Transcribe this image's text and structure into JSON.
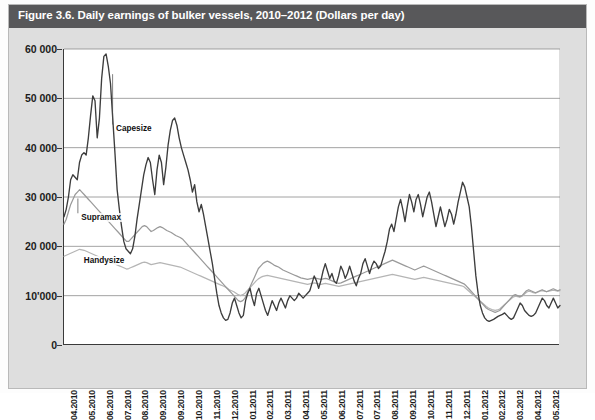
{
  "figure": {
    "title": "Figure 3.6. Daily earnings of bulker vessels, 2010–2012 (Dollars per day)"
  },
  "colors": {
    "title_bar": "#58585a",
    "panel_bg": "#dedede",
    "plot_bg": "#ffffff",
    "axis": "#3a3a3a",
    "grid": "#8c8c8c",
    "capesize": "#3d3d3d",
    "supramax": "#9a9a9a",
    "handysize": "#b5b5b5"
  },
  "chart_data": {
    "type": "line",
    "title": "Figure 3.6. Daily earnings of bulker vessels, 2010–2012 (Dollars per day)",
    "xlabel": "",
    "ylabel": "",
    "ylim": [
      0,
      60000
    ],
    "yticks": [
      0,
      10000,
      20000,
      30000,
      40000,
      50000,
      60000
    ],
    "ytick_labels": [
      "0",
      "10'000",
      "20 000",
      "30 000",
      "40 000",
      "50 000",
      "60 000"
    ],
    "grid": true,
    "legend": "inline-annotations",
    "xtick_labels": [
      "04.2010",
      "05.2010",
      "06.2010",
      "07.2010",
      "08.2010",
      "09.2010",
      "09.2010",
      "10.2010",
      "11.2010",
      "12.2010",
      "01.2011",
      "02.2011",
      "03.2011",
      "04.2011",
      "05.2011",
      "06.2011",
      "07.2011",
      "07.2011",
      "08.2011",
      "09.2011",
      "10.2011",
      "11.2011",
      "12.2011",
      "01.2012",
      "02.2012",
      "03.2012",
      "04.2012",
      "05.2012"
    ],
    "annotations": [
      {
        "text": "Capesize",
        "series": "Capesize"
      },
      {
        "text": "Supramax",
        "series": "Supramax"
      },
      {
        "text": "Handysize",
        "series": "Handysize"
      }
    ],
    "series": [
      {
        "name": "Capesize",
        "color": "#3d3d3d",
        "values": [
          26000,
          27500,
          30000,
          33500,
          34500,
          34000,
          33500,
          37000,
          38500,
          39000,
          38500,
          42000,
          46500,
          50500,
          49500,
          42000,
          46000,
          54000,
          58500,
          59000,
          56500,
          53000,
          46000,
          39000,
          31500,
          27500,
          24000,
          21000,
          19500,
          19000,
          18500,
          19500,
          22000,
          25500,
          28500,
          31500,
          34500,
          36500,
          38000,
          37000,
          33500,
          30500,
          35500,
          38500,
          37000,
          32500,
          36000,
          40500,
          43500,
          45500,
          46000,
          44500,
          42000,
          40000,
          38500,
          37000,
          35500,
          33500,
          31000,
          32500,
          29000,
          27000,
          28500,
          26500,
          24000,
          21500,
          19000,
          16500,
          13500,
          10500,
          8000,
          6500,
          5500,
          5000,
          5200,
          6500,
          8500,
          9500,
          8000,
          6500,
          5500,
          6000,
          9000,
          10500,
          11500,
          9500,
          8000,
          10500,
          11500,
          10000,
          8500,
          7000,
          6000,
          7500,
          9000,
          8000,
          7000,
          8500,
          9500,
          8500,
          7500,
          9000,
          10000,
          9500,
          9000,
          9500,
          10500,
          10000,
          9500,
          10000,
          10500,
          11000,
          12500,
          14000,
          13000,
          11500,
          13000,
          15000,
          16500,
          15000,
          13500,
          14500,
          13000,
          12500,
          14000,
          16000,
          15000,
          13500,
          14500,
          16000,
          14500,
          13000,
          12000,
          13500,
          14500,
          16500,
          17500,
          16000,
          14500,
          16000,
          17000,
          16500,
          15500,
          16000,
          17500,
          19000,
          21000,
          23500,
          24500,
          23000,
          25500,
          28000,
          29500,
          27500,
          25000,
          28000,
          30500,
          29000,
          27000,
          29500,
          30500,
          28500,
          26000,
          28000,
          30000,
          31000,
          29000,
          26500,
          24000,
          26000,
          28000,
          26000,
          24000,
          25500,
          27500,
          26500,
          24500,
          26500,
          29000,
          31000,
          33000,
          32000,
          30000,
          28000,
          24000,
          19000,
          14000,
          10500,
          8000,
          6500,
          5500,
          5000,
          4800,
          5000,
          5200,
          5500,
          5800,
          6000,
          6200,
          6500,
          6000,
          5500,
          5200,
          5500,
          6500,
          7500,
          8500,
          8000,
          7000,
          6500,
          6000,
          5800,
          6000,
          6500,
          7500,
          8500,
          9500,
          9000,
          8000,
          7500,
          8500,
          9500,
          8500,
          7500,
          8000
        ]
      },
      {
        "name": "Supramax",
        "color": "#9a9a9a",
        "values": [
          24500,
          25500,
          27000,
          28500,
          29500,
          30500,
          31000,
          31500,
          31000,
          30500,
          30000,
          29500,
          29000,
          28500,
          28000,
          27500,
          27000,
          26500,
          26000,
          25500,
          25000,
          24500,
          24000,
          23500,
          23000,
          22500,
          22000,
          21500,
          21000,
          21000,
          21500,
          22000,
          22500,
          23000,
          23500,
          24000,
          24200,
          24000,
          23500,
          23000,
          23200,
          23500,
          23800,
          24000,
          23800,
          23500,
          23200,
          23000,
          22800,
          22500,
          22200,
          22000,
          21800,
          21500,
          21000,
          20500,
          20000,
          19500,
          19000,
          18500,
          18000,
          17500,
          17000,
          16500,
          16000,
          15500,
          15000,
          14500,
          14000,
          13500,
          13000,
          12500,
          12000,
          11500,
          11000,
          10500,
          10000,
          9500,
          9000,
          8800,
          9000,
          9500,
          10500,
          11500,
          12500,
          13500,
          14500,
          15500,
          16000,
          16500,
          16800,
          17000,
          16800,
          16500,
          16200,
          16000,
          15800,
          15500,
          15200,
          15000,
          14800,
          14600,
          14400,
          14200,
          14000,
          13800,
          13600,
          13500,
          13400,
          13300,
          13400,
          13500,
          13600,
          13500,
          13400,
          13300,
          13400,
          13500,
          13400,
          13200,
          13000,
          12800,
          12600,
          12500,
          12600,
          12800,
          13000,
          13200,
          13400,
          13600,
          13800,
          14000,
          14200,
          14400,
          14600,
          14800,
          15000,
          15200,
          15400,
          15600,
          15800,
          16000,
          16200,
          16400,
          16600,
          16800,
          17000,
          17200,
          17000,
          16800,
          16600,
          16400,
          16200,
          16000,
          15800,
          15600,
          15400,
          15200,
          15400,
          15600,
          15800,
          16000,
          15800,
          15600,
          15400,
          15200,
          15000,
          14800,
          14600,
          14400,
          14200,
          14000,
          13800,
          13600,
          13400,
          13200,
          13000,
          12800,
          12600,
          12400,
          12000,
          11500,
          11000,
          10500,
          10000,
          9500,
          9000,
          8500,
          8000,
          7500,
          7200,
          7000,
          6800,
          6600,
          6800,
          7000,
          7500,
          8000,
          8500,
          9000,
          9500,
          10000,
          10200,
          10000,
          9800,
          10000,
          10500,
          11000,
          11200,
          11000,
          10800,
          10600,
          10800,
          11000,
          11200,
          11000,
          10800,
          11000,
          11200,
          11400,
          11200,
          11000,
          11200
        ]
      },
      {
        "name": "Handysize",
        "color": "#b5b5b5",
        "values": [
          18000,
          18200,
          18400,
          18600,
          18800,
          19000,
          19200,
          19400,
          19300,
          19200,
          19000,
          18800,
          18600,
          18400,
          18200,
          18000,
          17800,
          17600,
          17400,
          17200,
          17000,
          16800,
          16600,
          16400,
          16200,
          16000,
          15800,
          15600,
          15400,
          15500,
          15700,
          15900,
          16100,
          16300,
          16500,
          16700,
          16800,
          16700,
          16500,
          16300,
          16400,
          16500,
          16600,
          16700,
          16600,
          16500,
          16400,
          16300,
          16200,
          16100,
          16000,
          15900,
          15800,
          15600,
          15400,
          15200,
          15000,
          14800,
          14600,
          14400,
          14200,
          14000,
          13800,
          13600,
          13400,
          13200,
          13000,
          12800,
          12600,
          12400,
          12200,
          12000,
          11800,
          11500,
          11200,
          11000,
          10800,
          10500,
          10200,
          10000,
          10200,
          10500,
          11000,
          11500,
          12000,
          12500,
          13000,
          13400,
          13700,
          13900,
          14000,
          14100,
          14000,
          13900,
          13800,
          13700,
          13600,
          13500,
          13400,
          13300,
          13200,
          13100,
          13000,
          12900,
          12800,
          12700,
          12600,
          12500,
          12400,
          12300,
          12400,
          12500,
          12600,
          12500,
          12400,
          12300,
          12400,
          12500,
          12400,
          12300,
          12200,
          12100,
          12000,
          11900,
          12000,
          12100,
          12200,
          12300,
          12400,
          12500,
          12600,
          12700,
          12800,
          12900,
          13000,
          13100,
          13200,
          13300,
          13400,
          13500,
          13600,
          13700,
          13800,
          13900,
          14000,
          14100,
          14200,
          14300,
          14200,
          14100,
          14000,
          13900,
          13800,
          13700,
          13600,
          13500,
          13400,
          13300,
          13400,
          13500,
          13600,
          13700,
          13600,
          13500,
          13400,
          13300,
          13200,
          13100,
          13000,
          12900,
          12800,
          12700,
          12600,
          12500,
          12400,
          12300,
          12200,
          12100,
          12000,
          11800,
          11400,
          11000,
          10600,
          10200,
          9800,
          9400,
          9000,
          8600,
          8200,
          7800,
          7500,
          7300,
          7100,
          7000,
          7100,
          7300,
          7700,
          8100,
          8500,
          8900,
          9300,
          9700,
          9900,
          9800,
          9700,
          9900,
          10300,
          10700,
          10900,
          10800,
          10600,
          10500,
          10700,
          10900,
          11000,
          10900,
          10800,
          10900,
          11000,
          11100,
          11000,
          10900,
          11000
        ]
      }
    ]
  }
}
